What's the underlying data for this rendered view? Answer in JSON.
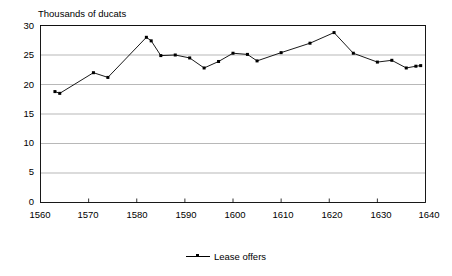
{
  "chart_data": {
    "type": "line",
    "title": "",
    "ylabel": "Thousands of ducats",
    "xlabel": "",
    "xlim": [
      1560,
      1640
    ],
    "ylim": [
      0,
      30
    ],
    "yticks": [
      0,
      5,
      10,
      15,
      20,
      25,
      30
    ],
    "xticks": [
      1560,
      1570,
      1580,
      1590,
      1600,
      1610,
      1620,
      1630,
      1640
    ],
    "grid": "horizontal",
    "legend_position": "bottom-center",
    "line_color": "#000000",
    "marker": "square",
    "series": [
      {
        "name": "Lease offers",
        "x": [
          1563,
          1564,
          1571,
          1574,
          1582,
          1583,
          1585,
          1588,
          1591,
          1594,
          1597,
          1600,
          1603,
          1605,
          1610,
          1616,
          1621,
          1625,
          1630,
          1633,
          1636,
          1638,
          1639
        ],
        "values": [
          18.8,
          18.5,
          22.0,
          21.2,
          28.0,
          27.4,
          24.9,
          25.0,
          24.5,
          22.8,
          23.9,
          25.3,
          25.1,
          24.0,
          25.4,
          27.0,
          28.8,
          25.3,
          23.8,
          24.1,
          22.8,
          23.1,
          23.2
        ]
      }
    ]
  },
  "legend": {
    "entries": [
      {
        "label": "Lease offers"
      }
    ]
  },
  "axis": {
    "y_title": "Thousands of ducats",
    "y_labels": [
      "30",
      "25",
      "20",
      "15",
      "10",
      "5",
      "0"
    ],
    "x_labels": [
      "1560",
      "1570",
      "1580",
      "1590",
      "1600",
      "1610",
      "1620",
      "1630",
      "1640"
    ]
  }
}
